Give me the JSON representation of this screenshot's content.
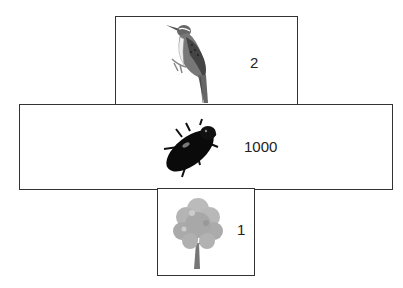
{
  "diagram": {
    "type": "pyramid-of-numbers",
    "tiers": [
      {
        "level": "top",
        "organism": "bird",
        "icon": "bird-icon",
        "count": "2"
      },
      {
        "level": "middle",
        "organism": "beetle",
        "icon": "beetle-icon",
        "count": "1000"
      },
      {
        "level": "bottom",
        "organism": "tree",
        "icon": "tree-icon",
        "count": "1"
      }
    ]
  }
}
